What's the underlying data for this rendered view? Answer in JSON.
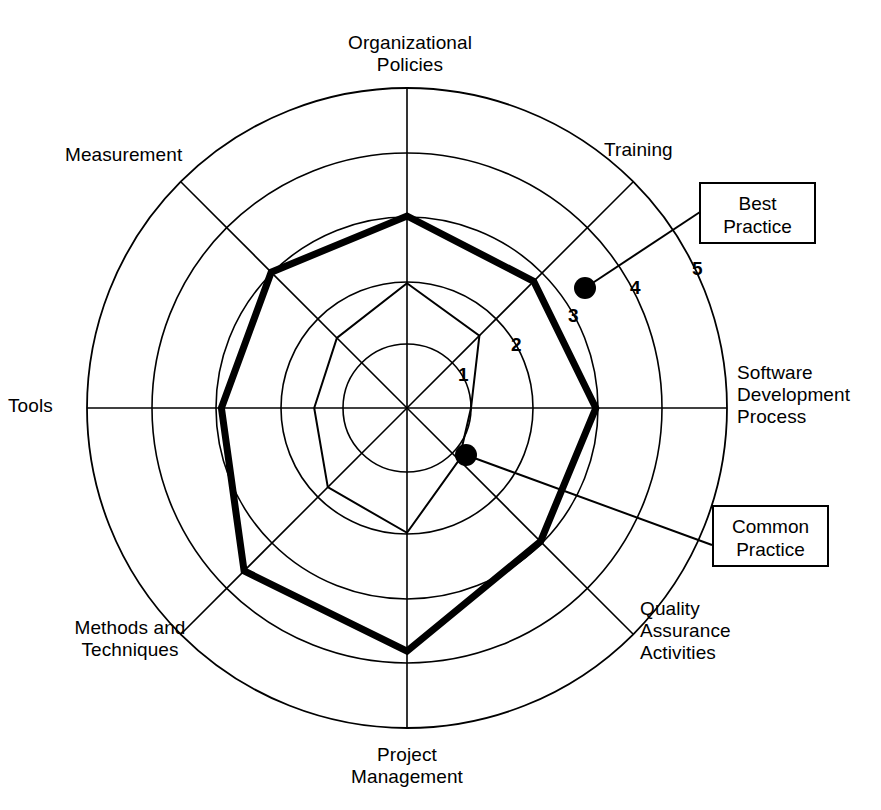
{
  "chart_data": {
    "type": "radar",
    "title": "",
    "axes": [
      "Organizational\nPolicies",
      "Training",
      "Software\nDevelopment\nProcess",
      "Quality\nAssurance\nActivities",
      "Project\nManagement",
      "Methods and\nTechniques",
      "Tools",
      "Measurement"
    ],
    "categories": [
      "Organizational Policies",
      "Training",
      "Software Development Process",
      "Quality Assurance Activities",
      "Project Management",
      "Methods and Techniques",
      "Tools",
      "Measurement"
    ],
    "scale_min": 0,
    "scale_max": 5,
    "tick_labels": [
      "1",
      "2",
      "3",
      "4",
      "5"
    ],
    "tick_values": [
      1,
      2,
      3,
      4,
      5
    ],
    "rings": 5,
    "grid": true,
    "legend_position": "right",
    "series": [
      {
        "name": "Best Practice",
        "style": "thick",
        "values": [
          3.0,
          2.8,
          2.95,
          2.95,
          3.8,
          3.6,
          2.9,
          3.0
        ]
      },
      {
        "name": "Common Practice",
        "style": "thin",
        "values": [
          1.95,
          1.6,
          1.0,
          1.15,
          1.95,
          1.75,
          1.45,
          1.55
        ]
      }
    ]
  },
  "axis_labels": {
    "organizational_policies": "Organizational\nPolicies",
    "training": "Training",
    "software_development_process": "Software\nDevelopment\nProcess",
    "quality_assurance_activities": "Quality\nAssurance\nActivities",
    "project_management": "Project\nManagement",
    "methods_and_techniques": "Methods and\nTechniques",
    "tools": "Tools",
    "measurement": "Measurement"
  },
  "ticks": {
    "t1": "1",
    "t2": "2",
    "t3": "3",
    "t4": "4",
    "t5": "5"
  },
  "legend": {
    "best_practice": "Best\nPractice",
    "common_practice": "Common\nPractice"
  },
  "colors": {
    "stroke": "#000000",
    "background": "#ffffff"
  }
}
